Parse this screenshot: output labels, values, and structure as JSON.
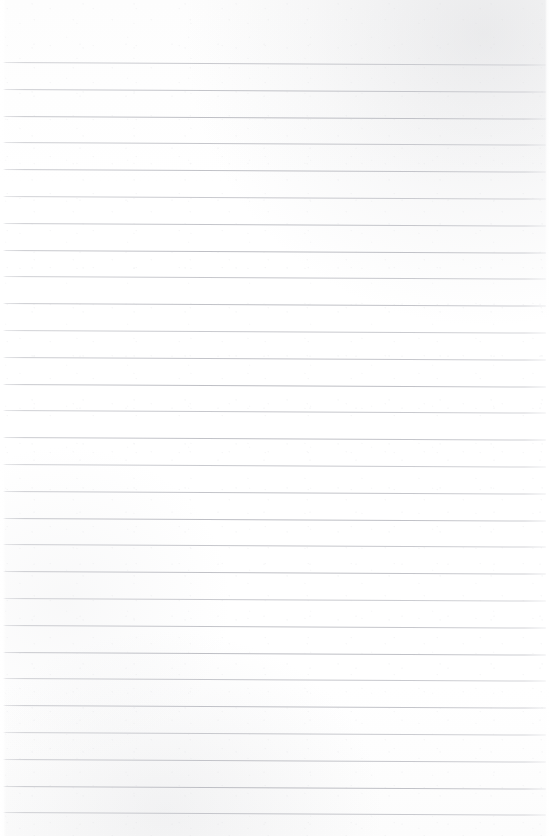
{
  "document": {
    "kind": "lined-paper-scan",
    "title": "Blank lined paper",
    "content_text": "",
    "page_width": 550,
    "page_height": 836
  },
  "paper": {
    "background_color": "#fefefe",
    "edge_highlight_color": "#ffffff",
    "scan_noise_color": "#cdced3"
  },
  "ruling": {
    "line_color": "#c4c5ca",
    "line_thickness": 1,
    "line_count": 29,
    "first_line_y": 62,
    "line_spacing": 26.8,
    "left_margin": 3,
    "right_margin": 4,
    "skew_drop_px": 2.6,
    "top_margin": 62,
    "bottom_margin": 23,
    "has_vertical_margin_rule": false,
    "line_positions_y": [
      62,
      88.8,
      115.6,
      142.4,
      169.2,
      196,
      222.8,
      249.6,
      276.4,
      303.2,
      330,
      356.8,
      383.6,
      410.4,
      437.2,
      464,
      490.8,
      517.6,
      544.4,
      571.2,
      598,
      624.8,
      651.6,
      678.4,
      705.2,
      732,
      758.8,
      785.6,
      812.4
    ]
  }
}
